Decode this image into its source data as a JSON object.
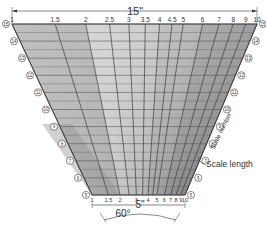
{
  "diagram": {
    "colors": {
      "ink": "#3a3a3a",
      "shade_dark": "#9a9a9a",
      "shade_mid": "#c4c4c4",
      "shade_light": "#e6e6e6",
      "background": "#ffffff"
    },
    "geometry": {
      "top_y": 24,
      "top_left_x": 12,
      "top_right_x": 257,
      "bottom_y": 195,
      "bottom_left_x": 92,
      "bottom_right_x": 185,
      "row_count": 20
    },
    "top_dimension": {
      "label": "15\""
    },
    "bottom_dimension": {
      "label": "5\""
    },
    "angle_dimension": {
      "label": "60°-5\""
    },
    "angle_label": "60°",
    "top_scale_labels": [
      "1",
      "1.5",
      "2",
      "2.5",
      "3",
      "3.5",
      "4",
      "4.5",
      "5",
      "6",
      "7",
      "8",
      "9",
      "10"
    ],
    "top_scale_values": [
      1,
      1.5,
      2,
      2.5,
      3,
      3.5,
      4,
      4.5,
      5,
      6,
      7,
      8,
      9,
      10
    ],
    "bottom_scale_labels": [
      "1",
      "1.5",
      "2",
      "3",
      "4",
      "5",
      "6",
      "7",
      "8",
      "9",
      "10"
    ],
    "bottom_scale_values": [
      1,
      1.5,
      2,
      3,
      4,
      5,
      6,
      7,
      8,
      9,
      10
    ],
    "scale_numbers_left": [
      "15",
      "14",
      "13",
      "12",
      "11",
      "10",
      "9",
      "8",
      "7",
      "6",
      "5"
    ],
    "scale_numbers_right": [
      "15",
      "14",
      "13",
      "12",
      "11",
      "10",
      "9",
      "8",
      "7",
      "6",
      "5"
    ],
    "annotations": {
      "scale_length": "Scale length",
      "scale_number": "Scale number"
    }
  }
}
